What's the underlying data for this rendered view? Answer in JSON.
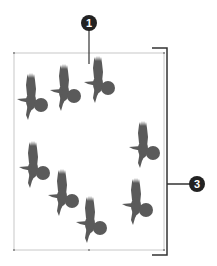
{
  "diagram": {
    "frame": {
      "x": 14,
      "y": 53,
      "width": 150,
      "height": 197,
      "color": "#c8c8c8"
    },
    "bird_color": "#5a5a5a",
    "birds": [
      {
        "x": 33,
        "y": 97
      },
      {
        "x": 66,
        "y": 88
      },
      {
        "x": 100,
        "y": 80
      },
      {
        "x": 145,
        "y": 145
      },
      {
        "x": 35,
        "y": 165
      },
      {
        "x": 64,
        "y": 193
      },
      {
        "x": 92,
        "y": 220
      },
      {
        "x": 138,
        "y": 202
      }
    ],
    "callouts": [
      {
        "label": "1",
        "x": 89,
        "y": 23
      },
      {
        "label": "3",
        "x": 197,
        "y": 184
      }
    ],
    "bracket_color": "#333333"
  }
}
